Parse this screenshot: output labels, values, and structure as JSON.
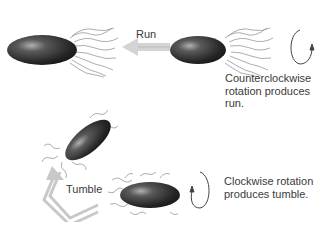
{
  "diagram": {
    "run": {
      "arrow_label": "Run",
      "caption_lines": [
        "Counterclockwise",
        "rotation produces",
        "run."
      ],
      "rotation_icon": "counterclockwise-arrow-icon"
    },
    "tumble": {
      "arrow_label": "Tumble",
      "caption_lines": [
        "Clockwise rotation",
        "produces tumble."
      ],
      "rotation_icon": "clockwise-arrow-icon"
    },
    "colors": {
      "cell_body_dark": "#1e1e1e",
      "cell_highlight": "#9a9a9a",
      "flagella": "#8a8a8a",
      "arrow": "#c8c8c8",
      "text": "#3a3a3a"
    }
  }
}
